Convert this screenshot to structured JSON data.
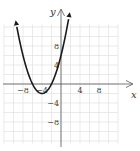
{
  "chart_data": {
    "type": "line",
    "title": "",
    "xlabel": "x",
    "ylabel": "y",
    "xlim": [
      -12,
      12
    ],
    "ylim": [
      -12,
      12
    ],
    "grid": true,
    "grid_step": 2,
    "x_ticks": [
      {
        "value": -8,
        "label": "−8"
      },
      {
        "value": -4,
        "label": "−4"
      },
      {
        "value": 4,
        "label": "4"
      },
      {
        "value": 8,
        "label": "8"
      }
    ],
    "y_ticks": [
      {
        "value": 8,
        "label": "8"
      },
      {
        "value": 4,
        "label": "4"
      },
      {
        "value": -4,
        "label": "−4"
      },
      {
        "value": -8,
        "label": "−8"
      }
    ],
    "series": [
      {
        "name": "parabola",
        "equation": "y = 0.5(x + 4)^2 - 2",
        "vertex": [
          -4,
          -2
        ],
        "x_intercepts": [
          -6,
          -2
        ],
        "y_intercept": 6,
        "x_range": [
          -9.3,
          1.6
        ],
        "arrows_both_ends": true,
        "color": "#1a1a1a"
      }
    ]
  }
}
